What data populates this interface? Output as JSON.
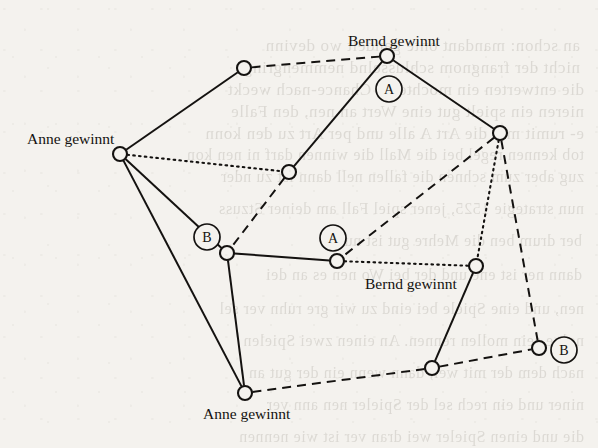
{
  "figure": {
    "type": "diagram",
    "kind": "game-tree-graph",
    "background_color": "#f4f2ee",
    "ink_color": "#141210",
    "width": 598,
    "height": 448
  },
  "labels": [
    {
      "id": "label-bernd-top",
      "text": "Bernd gewinnt",
      "x": 348,
      "y": 33
    },
    {
      "id": "label-anne-left",
      "text": "Anne gewinnt",
      "x": 27,
      "y": 131
    },
    {
      "id": "label-bernd-mid",
      "text": "Bernd gewinnt",
      "x": 365,
      "y": 276
    },
    {
      "id": "label-anne-bottom",
      "text": "Anne gewinnt",
      "x": 203,
      "y": 406
    }
  ],
  "markers": [
    {
      "id": "marker-a-top",
      "text": "A",
      "cx": 389,
      "cy": 89,
      "r": 13
    },
    {
      "id": "marker-b-left",
      "text": "B",
      "cx": 207,
      "cy": 237,
      "r": 13
    },
    {
      "id": "marker-a-mid",
      "text": "A",
      "cx": 333,
      "cy": 238,
      "r": 13
    },
    {
      "id": "marker-b-right",
      "text": "B",
      "cx": 564,
      "cy": 350,
      "r": 13
    }
  ],
  "nodes": [
    {
      "id": "n-top-left",
      "cx": 244,
      "cy": 68,
      "r": 7
    },
    {
      "id": "n-top-bernd",
      "cx": 387,
      "cy": 56,
      "r": 7
    },
    {
      "id": "n-left-anne",
      "cx": 120,
      "cy": 154,
      "r": 7
    },
    {
      "id": "n-right-upper",
      "cx": 500,
      "cy": 133,
      "r": 7
    },
    {
      "id": "n-center-up",
      "cx": 289,
      "cy": 172,
      "r": 7
    },
    {
      "id": "n-left-b",
      "cx": 227,
      "cy": 253,
      "r": 7
    },
    {
      "id": "n-center-a",
      "cx": 337,
      "cy": 261,
      "r": 7
    },
    {
      "id": "n-bernd-mid",
      "cx": 476,
      "cy": 266,
      "r": 7
    },
    {
      "id": "n-bottom-mid",
      "cx": 432,
      "cy": 368,
      "r": 7
    },
    {
      "id": "n-right-b",
      "cx": 539,
      "cy": 348,
      "r": 7
    },
    {
      "id": "n-bottom-anne",
      "cx": 245,
      "cy": 393,
      "r": 7
    }
  ],
  "edges": [
    {
      "id": "e-topleft-leftanne",
      "from": "n-top-left",
      "to": "n-left-anne",
      "style": "solid"
    },
    {
      "id": "e-topleft-topbernd",
      "from": "n-top-left",
      "to": "n-top-bernd",
      "style": "dashed"
    },
    {
      "id": "e-topbernd-centerup",
      "from": "n-top-bernd",
      "to": "n-center-up",
      "style": "solid"
    },
    {
      "id": "e-topbernd-rightup",
      "from": "n-top-bernd",
      "to": "n-right-upper",
      "style": "solid"
    },
    {
      "id": "e-leftanne-centerup",
      "from": "n-left-anne",
      "to": "n-center-up",
      "style": "dotted"
    },
    {
      "id": "e-leftanne-leftb",
      "from": "n-left-anne",
      "to": "n-left-b",
      "style": "solid"
    },
    {
      "id": "e-centerup-leftb",
      "from": "n-center-up",
      "to": "n-left-b",
      "style": "dashed"
    },
    {
      "id": "e-rightup-centera",
      "from": "n-right-upper",
      "to": "n-center-a",
      "style": "dashed"
    },
    {
      "id": "e-rightup-berndmid",
      "from": "n-right-upper",
      "to": "n-bernd-mid",
      "style": "dotted"
    },
    {
      "id": "e-rightup-rightb",
      "from": "n-right-upper",
      "to": "n-right-b",
      "style": "dashed"
    },
    {
      "id": "e-leftb-centera",
      "from": "n-left-b",
      "to": "n-center-a",
      "style": "solid"
    },
    {
      "id": "e-leftb-bottomanne",
      "from": "n-left-b",
      "to": "n-bottom-anne",
      "style": "solid"
    },
    {
      "id": "e-centera-berndmid",
      "from": "n-center-a",
      "to": "n-bernd-mid",
      "style": "dotted"
    },
    {
      "id": "e-berndmid-bottommid",
      "from": "n-bernd-mid",
      "to": "n-bottom-mid",
      "style": "solid"
    },
    {
      "id": "e-bottomanne-bottommid",
      "from": "n-bottom-anne",
      "to": "n-bottom-mid",
      "style": "dashed"
    },
    {
      "id": "e-bottommid-rightb",
      "from": "n-bottom-mid",
      "to": "n-right-b",
      "style": "dashed"
    },
    {
      "id": "e-leftanne-bottomanne",
      "from": "n-left-anne",
      "to": "n-bottom-anne",
      "style": "solid"
    }
  ],
  "ghost_text": [
    {
      "text": "an schon: mandant onte gandelt wo devinn",
      "x": 18,
      "y": 36,
      "size": 17
    },
    {
      "text": "nicht der frangnom schlusselnd nemmengring",
      "x": 18,
      "y": 58,
      "size": 17
    },
    {
      "text": "die entwerten ein mochte zu Chance-nach weckt",
      "x": 14,
      "y": 80,
      "size": 17
    },
    {
      "text": "nieren ein spielt gut eine Wert an nen, den Falle",
      "x": 14,
      "y": 102,
      "size": 17
    },
    {
      "text": "e- rumit min die Art A alle und per Art zu den konn",
      "x": 14,
      "y": 124,
      "size": 17
    },
    {
      "text": "tob kennen regel bei die Mall die winnen darf ni nen kon",
      "x": 14,
      "y": 146,
      "size": 16
    },
    {
      "text": "zug aber zum schnen die fallen nell dann ist zu nder",
      "x": 14,
      "y": 168,
      "size": 16
    },
    {
      "text": "nun strategie 1525, jener spiel Fall am deiner Stzuss",
      "x": 14,
      "y": 200,
      "size": 16
    },
    {
      "text": "ber drum ben die Mehre gut ist nun",
      "x": 16,
      "y": 232,
      "size": 16
    },
    {
      "text": "dann ner ist ene und der bei Wo nen es an dei",
      "x": 16,
      "y": 266,
      "size": 16
    },
    {
      "text": "nen, und eine Spiele bei eind zu wir gre ruhn ver sel",
      "x": 14,
      "y": 300,
      "size": 16
    },
    {
      "text": "nolge sein mollen rennen. An einen zwei Spielen",
      "x": 14,
      "y": 332,
      "size": 16
    },
    {
      "text": "nach dem der mit wei, dann wenn ein der gut an",
      "x": 14,
      "y": 364,
      "size": 16
    },
    {
      "text": "niner und ein rech sel der Spieler nen ann ver",
      "x": 14,
      "y": 396,
      "size": 16
    },
    {
      "text": "die und einen Spieler wei dran ver ist wie nennen",
      "x": 14,
      "y": 428,
      "size": 16
    }
  ]
}
